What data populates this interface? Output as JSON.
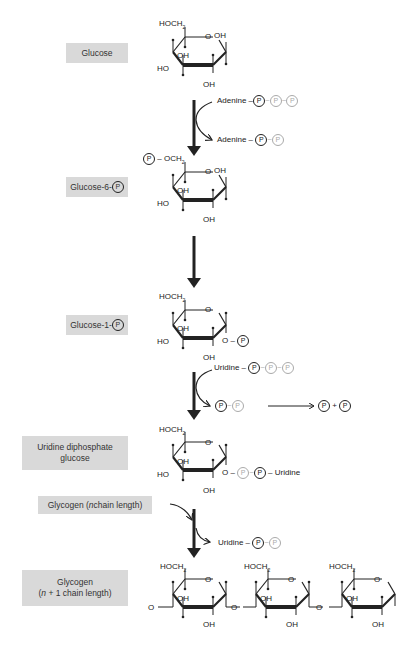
{
  "labels": {
    "glucose": "Glucose",
    "g6p_text": "Glucose-6-",
    "g1p_text": "Glucose-1-",
    "udpg_line1": "Uridine diphosphate",
    "udpg_line2": "glucose",
    "glycogen_n_pre": "Glycogen (",
    "glycogen_n_italic": "n",
    "glycogen_n_post": " chain length)",
    "glycogen_n1_line1": "Glycogen",
    "glycogen_n1_line2_italic": "n",
    "glycogen_n1_line2_post": " + 1 chain length)",
    "glycogen_n1_line2_pre": "("
  },
  "phosphate_symbol": "P",
  "tilde": "~",
  "dash": "–",
  "plus": "+",
  "reactants": {
    "atp_base": "Adenine",
    "adp_base": "Adenine",
    "utp_base": "Uridine",
    "udp_base": "Uridine",
    "udpg_tail": "Uridine"
  },
  "ring_text": {
    "hoch2": "HOCH",
    "sub2": "2",
    "och2": "OCH",
    "oh": "OH",
    "ho": "HO",
    "o": "O"
  },
  "colors": {
    "box_fill": "#d9d9d9",
    "ink": "#222222",
    "faint": "#aaaaaa"
  }
}
